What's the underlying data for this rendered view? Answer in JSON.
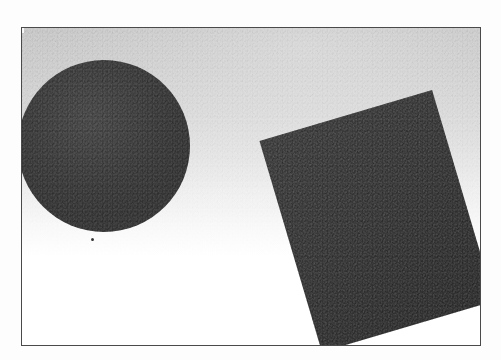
{
  "artwork": {
    "medium_note": "grainy halftone scan reproduction",
    "frame": {
      "border_color": "#4a4a4a",
      "border_width_px": 1,
      "left_px": 21,
      "top_px": 27,
      "width_px": 460,
      "height_px": 319
    },
    "background": {
      "gradient_direction": "top-to-bottom",
      "top_color": "#c3c3c3",
      "mid_color": "#e2e2e2",
      "bottom_color": "#ffffff"
    },
    "shapes": [
      {
        "id": "circle",
        "type": "circle",
        "fill": "#3a3a3a",
        "center_x_px": 104,
        "center_y_px": 146,
        "radius_px": 86,
        "note": "dark disc, left edge meets the frame line"
      },
      {
        "id": "rectangle",
        "type": "rectangle",
        "fill": "#343434",
        "rotation_deg": -16.5,
        "width_px": 180,
        "height_px": 220,
        "corner_top_x_px": 403,
        "corner_top_y_px": 127,
        "corner_right_x_px": 462,
        "corner_right_y_px": 280,
        "corner_left_x_px": 236,
        "corner_left_y_px": 202,
        "note": "tilted quadrilateral, bottom corner runs past the frame"
      },
      {
        "id": "speck",
        "type": "speck",
        "fill": "#3a3a3a",
        "center_x_px": 91,
        "center_y_px": 238,
        "size_px": 3,
        "note": "small print flaw below the disc"
      }
    ],
    "canvas": {
      "width_px": 501,
      "height_px": 360,
      "paper_color": "#fdfdfd"
    }
  }
}
